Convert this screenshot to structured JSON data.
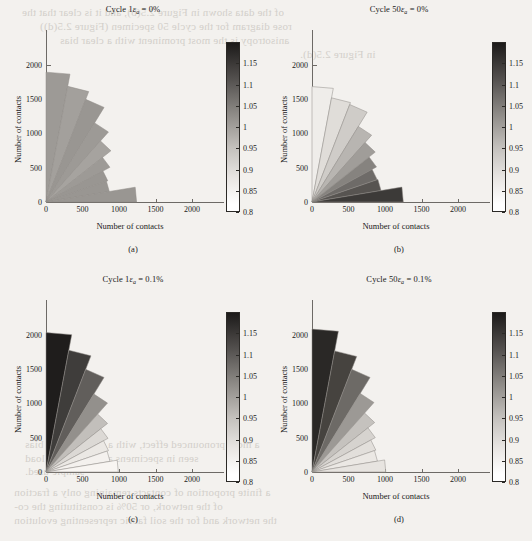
{
  "figure": {
    "background": "#f3f1ee",
    "axis_color": "#6d6a66",
    "text_color": "#1a1a1a",
    "xlabel": "Number of contacts",
    "ylabel": "Number of contacts"
  },
  "bleed_text": [
    {
      "text": "of the data shown in Figure 2.5(b), and it is clear that the",
      "x": 22,
      "y": 6
    },
    {
      "text": "rose diagram for the cycle 50 specimen (Figure 2.5(d))",
      "x": 40,
      "y": 20
    },
    {
      "text": "anisotropy is the most prominent with a clear bias",
      "x": 60,
      "y": 34
    },
    {
      "text": "in Figure 2.5(d).",
      "x": 300,
      "y": 48
    },
    {
      "text": "a more pronounced effect, with a clear contact bias",
      "x": 25,
      "y": 438
    },
    {
      "text": "seen in specimens after a 1 cycle load",
      "x": 25,
      "y": 452
    },
    {
      "text": "sample used.",
      "x": 25,
      "y": 465
    },
    {
      "text": "a finite proportion of contacts remaining only a fraction",
      "x": 14,
      "y": 486
    },
    {
      "text": "of the network, or 50% is constituting the co-",
      "x": 14,
      "y": 500
    },
    {
      "text": "the network and for the soil fabric representing evolution",
      "x": 14,
      "y": 514
    }
  ],
  "colorbar": {
    "vmin": 0.8,
    "vmax": 1.2,
    "ticks": [
      "1.15",
      "1.1",
      "1.05",
      "1",
      "0.95",
      "0.9",
      "0.85",
      "0.8"
    ],
    "tick_values": [
      1.15,
      1.1,
      1.05,
      1.0,
      0.95,
      0.9,
      0.85,
      0.8
    ],
    "gradient_top": "#1c1a19",
    "gradient_bottom": "#ffffff"
  },
  "panels": [
    {
      "id": "a",
      "label": "(a)",
      "title_prefix": "Cycle 1",
      "title_eps": "ε",
      "title_sub": "a",
      "title_suffix": " = 0%",
      "title_plain": "Cycle 1εa = 0%"
    },
    {
      "id": "b",
      "label": "(b)",
      "title_prefix": "Cycle 50",
      "title_eps": "ε",
      "title_sub": "a",
      "title_suffix": " = 0%",
      "title_plain": "Cycle 50εa = 0%"
    },
    {
      "id": "c",
      "label": "(c)",
      "title_prefix": "Cycle 1",
      "title_eps": "ε",
      "title_sub": "a",
      "title_suffix": " = 0.1%",
      "title_plain": "Cycle 1εa = 0.1%"
    },
    {
      "id": "d",
      "label": "(d)",
      "title_prefix": "Cycle 50",
      "title_eps": "ε",
      "title_sub": "a",
      "title_suffix": " = 0.1%",
      "title_plain": "Cycle 50εa = 0.1%"
    }
  ],
  "chart_data": [
    {
      "type": "bar",
      "subtype": "polar-rose-quarter",
      "panel": "a",
      "title": "Cycle 1εa = 0%",
      "xlabel": "Number of contacts",
      "ylabel": "Number of contacts",
      "xlim": [
        0,
        2300
      ],
      "ylim": [
        0,
        2300
      ],
      "xticks": [
        0,
        500,
        1000,
        1500,
        2000
      ],
      "yticks": [
        0,
        500,
        1000,
        1500,
        2000
      ],
      "grid": false,
      "legend": "colorbar-right",
      "angle_bin_deg": 10,
      "angle_bins_deg": [
        [
          80,
          90
        ],
        [
          70,
          80
        ],
        [
          60,
          70
        ],
        [
          50,
          60
        ],
        [
          40,
          50
        ],
        [
          30,
          40
        ],
        [
          20,
          30
        ],
        [
          10,
          20
        ],
        [
          0,
          10
        ]
      ],
      "radii": [
        1890,
        1710,
        1590,
        1330,
        1160,
        1010,
        900,
        880,
        1240
      ],
      "colors": [
        0.99,
        0.98,
        1.0,
        0.99,
        0.97,
        0.99,
        1.0,
        1.0,
        1.0
      ],
      "fill_hex": [
        "#9d9a96",
        "#a3a09c",
        "#999692",
        "#9d9a96",
        "#a6a39f",
        "#9d9a96",
        "#999692",
        "#999692",
        "#999692"
      ]
    },
    {
      "type": "bar",
      "subtype": "polar-rose-quarter",
      "panel": "b",
      "title": "Cycle 50εa = 0%",
      "xlabel": "Number of contacts",
      "ylabel": "Number of contacts",
      "xlim": [
        0,
        2300
      ],
      "ylim": [
        0,
        2300
      ],
      "xticks": [
        0,
        500,
        1000,
        1500,
        2000
      ],
      "yticks": [
        0,
        500,
        1000,
        1500,
        2000
      ],
      "grid": false,
      "legend": "colorbar-right",
      "angle_bin_deg": 10,
      "angle_bins_deg": [
        [
          80,
          90
        ],
        [
          70,
          80
        ],
        [
          60,
          70
        ],
        [
          50,
          60
        ],
        [
          40,
          50
        ],
        [
          30,
          40
        ],
        [
          20,
          30
        ],
        [
          10,
          20
        ],
        [
          0,
          10
        ]
      ],
      "radii": [
        1680,
        1540,
        1510,
        1270,
        1130,
        1020,
        950,
        960,
        1250
      ],
      "colors": [
        0.83,
        0.86,
        0.89,
        0.95,
        1.0,
        1.06,
        1.1,
        1.14,
        1.18
      ],
      "fill_hex": [
        "#efedea",
        "#e0ddd9",
        "#cfccc8",
        "#b8b5b1",
        "#a09d99",
        "#86837f",
        "#6e6b68",
        "#575451",
        "#3c3a38"
      ]
    },
    {
      "type": "bar",
      "subtype": "polar-rose-quarter",
      "panel": "c",
      "title": "Cycle 1εa = 0.1%",
      "xlabel": "Number of contacts",
      "ylabel": "Number of contacts",
      "xlim": [
        0,
        2300
      ],
      "ylim": [
        0,
        2300
      ],
      "xticks": [
        0,
        500,
        1000,
        1500,
        2000
      ],
      "yticks": [
        0,
        500,
        1000,
        1500,
        2000
      ],
      "grid": false,
      "legend": "colorbar-right",
      "angle_bin_deg": 10,
      "angle_bins_deg": [
        [
          80,
          90
        ],
        [
          70,
          80
        ],
        [
          60,
          70
        ],
        [
          50,
          60
        ],
        [
          40,
          50
        ],
        [
          30,
          40
        ],
        [
          20,
          30
        ],
        [
          10,
          20
        ],
        [
          0,
          10
        ]
      ],
      "radii": [
        2030,
        1800,
        1590,
        1310,
        1100,
        980,
        910,
        890,
        990
      ],
      "colors": [
        1.19,
        1.13,
        1.07,
        0.99,
        0.92,
        0.87,
        0.84,
        0.82,
        0.81
      ],
      "fill_hex": [
        "#1f1d1c",
        "#3f3d3b",
        "#615e5b",
        "#93908c",
        "#c2bfbb",
        "#dcd9d5",
        "#ebe8e4",
        "#f4f1ee",
        "#f8f5f2"
      ]
    },
    {
      "type": "bar",
      "subtype": "polar-rose-quarter",
      "panel": "d",
      "title": "Cycle 50εa = 0.1%",
      "xlabel": "Number of contacts",
      "ylabel": "Number of contacts",
      "xlim": [
        0,
        2300
      ],
      "ylim": [
        0,
        2300
      ],
      "xticks": [
        0,
        500,
        1000,
        1500,
        2000
      ],
      "yticks": [
        0,
        500,
        1000,
        1500,
        2000
      ],
      "grid": false,
      "legend": "colorbar-right",
      "angle_bin_deg": 10,
      "angle_bins_deg": [
        [
          80,
          90
        ],
        [
          70,
          80
        ],
        [
          60,
          70
        ],
        [
          50,
          60
        ],
        [
          40,
          50
        ],
        [
          30,
          40
        ],
        [
          20,
          30
        ],
        [
          10,
          20
        ],
        [
          0,
          10
        ]
      ],
      "radii": [
        2080,
        1790,
        1590,
        1320,
        1120,
        1000,
        930,
        910,
        1010
      ],
      "colors": [
        1.18,
        1.12,
        1.05,
        0.97,
        0.91,
        0.88,
        0.86,
        0.84,
        0.85
      ],
      "fill_hex": [
        "#2a2826",
        "#46433f",
        "#6d6a66",
        "#9c9995",
        "#c5c2be",
        "#d6d3cf",
        "#e2dfdb",
        "#ebe8e4",
        "#e7e4e0"
      ]
    }
  ]
}
